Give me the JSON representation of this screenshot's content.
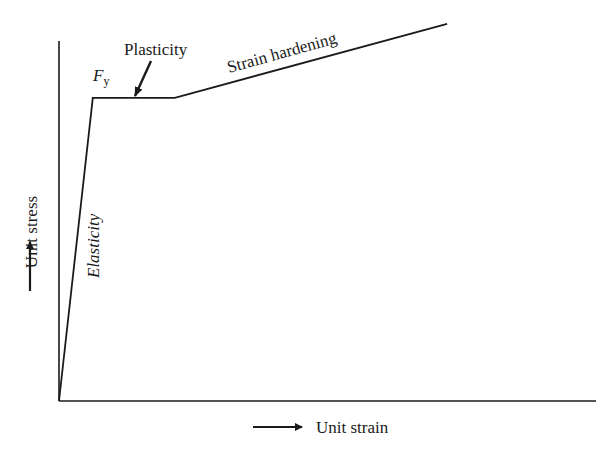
{
  "diagram": {
    "type": "stress-strain-curve",
    "axis_labels": {
      "y": "Unit stress",
      "x": "Unit strain"
    },
    "regions": [
      {
        "name": "elasticity",
        "label": "Elasticity"
      },
      {
        "name": "plasticity",
        "label": "Plasticity"
      },
      {
        "name": "strain-hardening",
        "label": "Strain hardening"
      }
    ],
    "yield_point": {
      "symbol": "F",
      "subscript": "y"
    },
    "curve_points_normalized": [
      {
        "strain": 0.0,
        "stress": 0.0
      },
      {
        "strain": 0.063,
        "stress": 0.84
      },
      {
        "strain": 0.216,
        "stress": 0.84
      },
      {
        "strain": 0.724,
        "stress": 1.045
      }
    ],
    "colors": {
      "line": "#1a1a1a",
      "background": "#ffffff"
    }
  }
}
